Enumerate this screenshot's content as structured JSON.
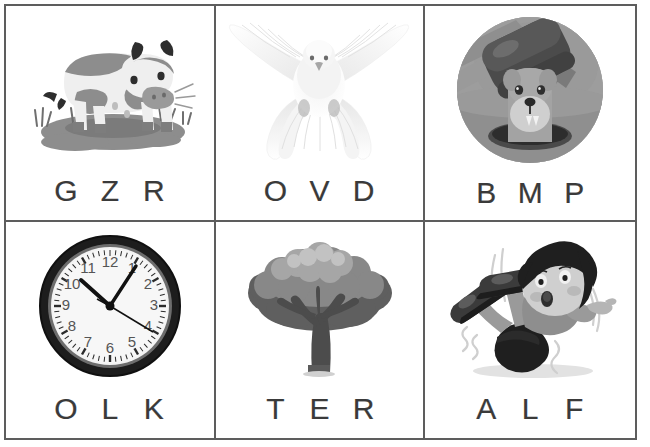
{
  "worksheet": {
    "title": "Beginning sound letter choice worksheet",
    "border_color": "#5d5d5d",
    "background_color": "#ffffff",
    "letter_color": "#3a3a3a",
    "columns": 3,
    "rows": 2
  },
  "cells": [
    {
      "id": "cell-1",
      "picture_name": "cow-illustration",
      "picture_caption": "Spotted cow standing on a mud puddle with grass tufts",
      "letters": [
        "G",
        "Z",
        "R"
      ]
    },
    {
      "id": "cell-2",
      "picture_name": "dove-illustration",
      "picture_caption": "White dove flying with wings spread, front view",
      "letters": [
        "O",
        "V",
        "D"
      ]
    },
    {
      "id": "cell-3",
      "picture_name": "whack-a-mole-illustration",
      "picture_caption": "Round badge of a mallet above a dog popping out of a hole",
      "letters": [
        "B",
        "M",
        "P"
      ]
    },
    {
      "id": "cell-4",
      "picture_name": "wall-clock-illustration",
      "picture_caption": "Round analog wall clock with black rim showing about five past one",
      "clock": {
        "hour_numerals": [
          "12",
          "1",
          "2",
          "3",
          "4",
          "5",
          "6",
          "7",
          "8",
          "9",
          "10",
          "11"
        ],
        "time_shown": "1:05"
      },
      "letters": [
        "O",
        "L",
        "K"
      ]
    },
    {
      "id": "cell-5",
      "picture_name": "tree-illustration",
      "picture_caption": "Broad leafy tree with rounded canopy and branching trunk",
      "letters": [
        "T",
        "E",
        "R"
      ]
    },
    {
      "id": "cell-6",
      "picture_name": "falling-boy-illustration",
      "picture_caption": "Cartoon boy slipping and falling backward with arms and legs flailing",
      "letters": [
        "A",
        "L",
        "F"
      ]
    }
  ]
}
